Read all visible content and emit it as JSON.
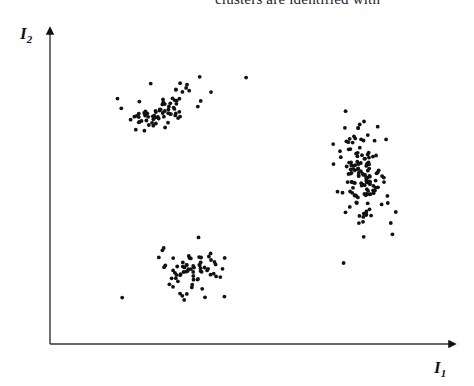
{
  "header": {
    "partial_text": "clusters are identified with"
  },
  "chart_data": {
    "type": "scatter",
    "title": "",
    "xlabel": "I1",
    "ylabel": "I2",
    "xlabel_main": "I",
    "xlabel_sub": "1",
    "ylabel_main": "I",
    "ylabel_sub": "2",
    "grid": false,
    "legend": null,
    "ticks": "none",
    "xlim": [
      0,
      100
    ],
    "ylim": [
      0,
      100
    ],
    "series": [
      {
        "name": "cluster-upper-left",
        "center": [
          28,
          77
        ],
        "spread": [
          9,
          5
        ],
        "shape": "elongated diagonal",
        "count": 75
      },
      {
        "name": "cluster-right",
        "center": [
          78,
          56
        ],
        "spread": [
          5,
          14
        ],
        "shape": "vertically elongated",
        "count": 140
      },
      {
        "name": "cluster-bottom",
        "center": [
          36,
          24
        ],
        "spread": [
          7,
          6
        ],
        "shape": "round",
        "count": 70
      }
    ]
  }
}
